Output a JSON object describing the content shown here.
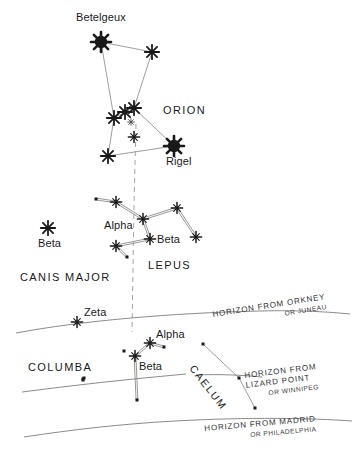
{
  "chart": {
    "type": "star-chart",
    "title": "",
    "background_color": "#ffffff",
    "ink_color": "#1a1a1a",
    "line_color": "#8a8a8a",
    "width": 356,
    "height": 465
  },
  "star_labels": {
    "betelgeux": "Betelgeux",
    "rigel": "Rigel",
    "orion": "ORION",
    "lepus_alpha": "Alpha",
    "lepus_beta": "Beta",
    "lepus": "LEPUS",
    "canismajor_beta": "Beta",
    "canis_major": "CANIS MAJOR",
    "columba_zeta": "Zeta",
    "columba_alpha": "Alpha",
    "columba_beta": "Beta",
    "columba": "COLUMBA",
    "caelum": "CAELUM"
  },
  "horizons": [
    {
      "id": "orkney",
      "line1": "HORIZON FROM ORKNEY",
      "line2": "OR JUNEAU"
    },
    {
      "id": "lizard-point",
      "line1": "HORIZON FROM",
      "line2": "LIZARD POINT",
      "line3": "OR WINNIPEG"
    },
    {
      "id": "madrid",
      "line1": "HORIZON FROM MADRID",
      "line2": "OR PHILADELPHIA"
    }
  ],
  "constellations": [
    {
      "name": "ORION",
      "stars": [
        {
          "id": "betelgeux",
          "label": "Betelgeux",
          "x": 101,
          "y": 42,
          "mag": "bright"
        },
        {
          "id": "orion-bellatrix",
          "label": "",
          "x": 152,
          "y": 52,
          "mag": "medium"
        },
        {
          "id": "orion-belt-w",
          "label": "",
          "x": 114,
          "y": 118,
          "mag": "medium"
        },
        {
          "id": "orion-belt-m",
          "label": "",
          "x": 125,
          "y": 112,
          "mag": "medium"
        },
        {
          "id": "orion-belt-e",
          "label": "",
          "x": 134,
          "y": 108,
          "mag": "medium"
        },
        {
          "id": "orion-nebula",
          "label": "",
          "x": 131,
          "y": 122,
          "mag": "faint"
        },
        {
          "id": "orion-sword",
          "label": "",
          "x": 134,
          "y": 137,
          "mag": "small"
        },
        {
          "id": "rigel",
          "label": "Rigel",
          "x": 174,
          "y": 146,
          "mag": "bright"
        },
        {
          "id": "orion-saiph",
          "label": "",
          "x": 108,
          "y": 156,
          "mag": "medium"
        }
      ],
      "links": [
        [
          "betelgeux",
          "orion-bellatrix"
        ],
        [
          "betelgeux",
          "orion-belt-w"
        ],
        [
          "orion-bellatrix",
          "orion-belt-e"
        ],
        [
          "orion-belt-w",
          "orion-belt-m"
        ],
        [
          "orion-belt-m",
          "orion-belt-e"
        ],
        [
          "orion-belt-e",
          "rigel"
        ],
        [
          "orion-belt-w",
          "orion-saiph"
        ],
        [
          "orion-saiph",
          "rigel"
        ]
      ]
    },
    {
      "name": "LEPUS",
      "stars": [
        {
          "id": "lepus-nw-dot",
          "label": "",
          "x": 96,
          "y": 199,
          "mag": "dot"
        },
        {
          "id": "lepus-nw",
          "label": "",
          "x": 116,
          "y": 202,
          "mag": "small"
        },
        {
          "id": "lepus-alpha",
          "label": "Alpha",
          "x": 143,
          "y": 219,
          "mag": "small"
        },
        {
          "id": "lepus-ne",
          "label": "",
          "x": 177,
          "y": 208,
          "mag": "small"
        },
        {
          "id": "lepus-beta",
          "label": "Beta",
          "x": 150,
          "y": 239,
          "mag": "small"
        },
        {
          "id": "lepus-se",
          "label": "",
          "x": 196,
          "y": 237,
          "mag": "small"
        },
        {
          "id": "lepus-sw",
          "label": "",
          "x": 116,
          "y": 246,
          "mag": "small"
        },
        {
          "id": "lepus-sw-dot",
          "label": "",
          "x": 127,
          "y": 257,
          "mag": "dot"
        }
      ],
      "links": [
        [
          "lepus-nw-dot",
          "lepus-nw"
        ],
        [
          "lepus-nw",
          "lepus-alpha"
        ],
        [
          "lepus-alpha",
          "lepus-ne"
        ],
        [
          "lepus-ne",
          "lepus-se"
        ],
        [
          "lepus-alpha",
          "lepus-beta"
        ],
        [
          "lepus-beta",
          "lepus-sw"
        ],
        [
          "lepus-sw",
          "lepus-sw-dot"
        ]
      ]
    },
    {
      "name": "CANIS MAJOR",
      "stars": [
        {
          "id": "cma-beta",
          "label": "Beta",
          "x": 48,
          "y": 228,
          "mag": "medium"
        }
      ],
      "links": []
    },
    {
      "name": "COLUMBA",
      "stars": [
        {
          "id": "col-zeta",
          "label": "Zeta",
          "x": 77,
          "y": 322,
          "mag": "small"
        },
        {
          "id": "col-w-dot",
          "label": "",
          "x": 83,
          "y": 379,
          "mag": "dot"
        },
        {
          "id": "col-nw-dot",
          "label": "",
          "x": 84,
          "y": 378,
          "mag": "dot"
        },
        {
          "id": "col-top-dot",
          "label": "",
          "x": 83,
          "y": 380,
          "mag": "dot"
        },
        {
          "id": "col-mid-dot",
          "label": "",
          "x": 124,
          "y": 351,
          "mag": "dot"
        },
        {
          "id": "col-beta",
          "label": "Beta",
          "x": 135,
          "y": 356,
          "mag": "small"
        },
        {
          "id": "col-alpha",
          "label": "Alpha",
          "x": 150,
          "y": 343,
          "mag": "small"
        },
        {
          "id": "col-e-dot",
          "label": "",
          "x": 164,
          "y": 347,
          "mag": "dot"
        },
        {
          "id": "col-s-dot",
          "label": "",
          "x": 137,
          "y": 400,
          "mag": "dot"
        }
      ],
      "links": [
        [
          "col-beta",
          "col-alpha"
        ],
        [
          "col-alpha",
          "col-e-dot"
        ],
        [
          "col-beta",
          "col-s-dot"
        ]
      ]
    },
    {
      "name": "CAELUM",
      "stars": [
        {
          "id": "cae-n",
          "label": "",
          "x": 203,
          "y": 344,
          "mag": "dot"
        },
        {
          "id": "cae-m",
          "label": "",
          "x": 239,
          "y": 378,
          "mag": "dot"
        },
        {
          "id": "cae-s",
          "label": "",
          "x": 255,
          "y": 408,
          "mag": "dot"
        }
      ],
      "links": [
        [
          "cae-n",
          "cae-m"
        ],
        [
          "cae-m",
          "cae-s"
        ]
      ]
    }
  ]
}
